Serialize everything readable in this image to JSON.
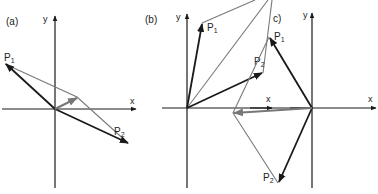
{
  "figure": {
    "panels": [
      {
        "id": "a",
        "label": "(a)",
        "x_axis_label": "x",
        "y_axis_label": "y",
        "vectors": [
          {
            "name": "P1",
            "label": "P",
            "sub": "1"
          },
          {
            "name": "P2",
            "label": "P",
            "sub": "2"
          }
        ]
      },
      {
        "id": "b",
        "label": "(b)",
        "x_axis_label": "x",
        "y_axis_label": "y",
        "vectors": [
          {
            "name": "P1",
            "label": "P",
            "sub": "1"
          },
          {
            "name": "P2",
            "label": "P",
            "sub": "2"
          }
        ]
      },
      {
        "id": "c",
        "label": "c)",
        "x_axis_label": "x",
        "y_axis_label": "y",
        "vectors": [
          {
            "name": "P1",
            "label": "P",
            "sub": "1"
          },
          {
            "name": "P2",
            "label": "P",
            "sub": "2"
          }
        ]
      }
    ],
    "colors": {
      "axis": "#1a1a1a",
      "vector": "#1a1a1a",
      "construction": "#7a7a7a",
      "resultant": "#777777"
    }
  }
}
